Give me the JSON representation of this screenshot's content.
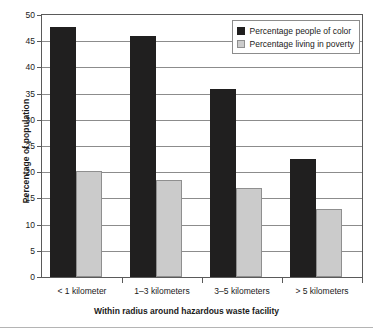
{
  "chart_data": {
    "type": "bar",
    "title": "",
    "xlabel": "Within radius around hazardous waste facility",
    "ylabel": "Percentage of population",
    "categories": [
      "< 1 kilometer",
      "1–3 kilometers",
      "3–5 kilometers",
      "> 5 kilometers"
    ],
    "series": [
      {
        "name": "Percentage people of color",
        "color": "#201f1f",
        "values": [
          47.7,
          46.0,
          35.8,
          22.5
        ]
      },
      {
        "name": "Percentage living in poverty",
        "color": "#cbcbcb",
        "values": [
          20.2,
          18.5,
          17.0,
          13.0
        ]
      }
    ],
    "ylim": [
      0,
      50
    ],
    "ytick_values": [
      0,
      5,
      10,
      15,
      20,
      25,
      30,
      35,
      40,
      45,
      50
    ],
    "ytick_labels": [
      "0",
      "5",
      "10",
      "15",
      "20",
      "25",
      "30",
      "35",
      "40",
      "45",
      "50"
    ],
    "grid": true,
    "legend_position": "top-right-inside"
  }
}
